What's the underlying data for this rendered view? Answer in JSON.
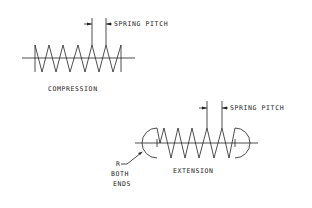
{
  "diagram": {
    "stroke_color": "#222222",
    "background": "#ffffff",
    "compression": {
      "label": "COMPRESSION",
      "pitch_label": "SPRING PITCH",
      "coil_count": 6
    },
    "extension": {
      "label": "EXTENSION",
      "pitch_label": "SPRING PITCH",
      "end_note_line1": "R",
      "end_note_line2": "BOTH",
      "end_note_line3": "ENDS",
      "coil_count": 6
    }
  }
}
